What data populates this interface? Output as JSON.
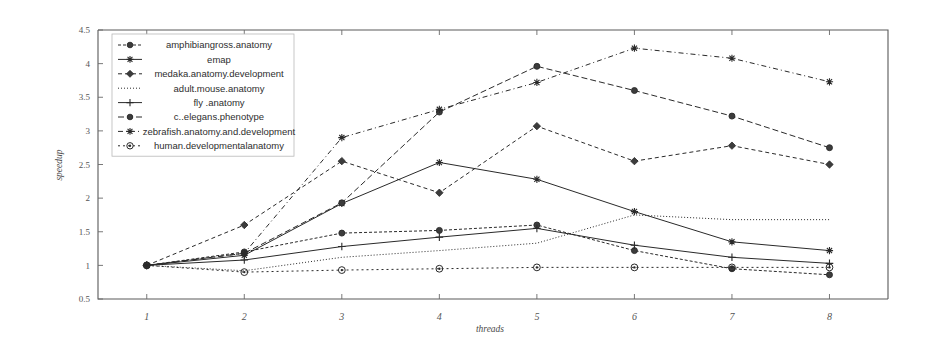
{
  "chart_data": {
    "type": "line",
    "title": "",
    "xlabel": "threads",
    "ylabel": "speedup",
    "x": [
      1,
      2,
      3,
      4,
      5,
      6,
      7,
      8
    ],
    "xtick_labels": [
      "1",
      "2",
      "3",
      "4",
      "5",
      "6",
      "7",
      "8"
    ],
    "ytick_labels": [
      "0.5",
      "1",
      "1.5",
      "2",
      "2.5",
      "3",
      "3.5",
      "4",
      "4.5"
    ],
    "ytick_values": [
      0.5,
      1,
      1.5,
      2,
      2.5,
      3,
      3.5,
      4,
      4.5
    ],
    "xlim": [
      0.5,
      8.6
    ],
    "ylim": [
      0.5,
      4.5
    ],
    "grid": false,
    "legend_position": "upper-left-inside",
    "series": [
      {
        "name": "amphibiangross.anatomy",
        "marker": "circle",
        "dash": "3,2",
        "values": [
          1.0,
          1.2,
          1.48,
          1.52,
          1.6,
          1.22,
          0.95,
          0.86
        ]
      },
      {
        "name": "emap",
        "marker": "asterisk",
        "dash": "none",
        "values": [
          1.0,
          1.15,
          1.92,
          2.53,
          2.28,
          1.8,
          1.35,
          1.22
        ]
      },
      {
        "name": "medaka.anatomy.development",
        "marker": "diamond",
        "dash": "4,3",
        "values": [
          1.0,
          1.6,
          2.55,
          2.08,
          3.07,
          2.55,
          2.78,
          2.5
        ]
      },
      {
        "name": "adult.mouse.anatomy",
        "marker": "none",
        "dash": "1,2",
        "values": [
          1.0,
          0.92,
          1.12,
          1.22,
          1.33,
          1.75,
          1.68,
          1.68
        ]
      },
      {
        "name": "fly .anatomy",
        "marker": "plus",
        "dash": "none",
        "values": [
          1.0,
          1.08,
          1.28,
          1.42,
          1.55,
          1.3,
          1.12,
          1.03
        ]
      },
      {
        "name": "c..elegans.phenotype",
        "marker": "circle",
        "dash": "6,3",
        "values": [
          1.0,
          1.18,
          1.93,
          3.28,
          3.96,
          3.6,
          3.22,
          2.75
        ]
      },
      {
        "name": "zebrafish.anatomy.and.development",
        "marker": "asterisk",
        "dash": "5,3,1,3",
        "values": [
          1.0,
          1.18,
          2.9,
          3.32,
          3.72,
          4.23,
          4.08,
          3.73
        ]
      },
      {
        "name": "human.developmentalanatomy",
        "marker": "circle-dot",
        "dash": "2,3",
        "values": [
          1.0,
          0.9,
          0.93,
          0.95,
          0.97,
          0.97,
          0.97,
          0.97
        ]
      }
    ]
  },
  "legend": {
    "items": [
      "amphibiangross.anatomy",
      "emap",
      "medaka.anatomy.development",
      "adult.mouse.anatomy",
      "fly .anatomy",
      "c..elegans.phenotype",
      "zebrafish.anatomy.and.development",
      "human.developmentalanatomy"
    ]
  },
  "axes": {
    "ylabel": "speedup",
    "xlabel": "threads"
  }
}
